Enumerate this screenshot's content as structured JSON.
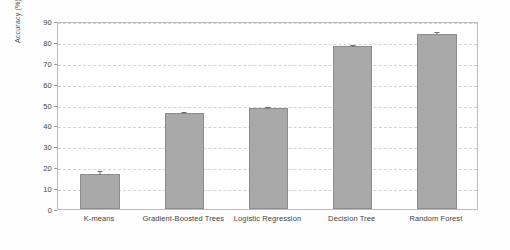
{
  "chart_data": {
    "type": "bar",
    "title": "",
    "xlabel": "",
    "ylabel": "Accuracy (%)",
    "categories": [
      "K-means",
      "Gradient-Boosted Trees",
      "Logistic Regression",
      "Decision Tree",
      "Random Forest"
    ],
    "values": [
      17,
      46,
      48.5,
      78,
      84
    ],
    "errors": [
      1.8,
      0.8,
      0.9,
      1.2,
      1.0
    ],
    "ylim": [
      0,
      90
    ],
    "ytick_labels": [
      "0",
      "10",
      "20",
      "30",
      "40",
      "50",
      "60",
      "70",
      "80",
      "90"
    ],
    "ytick_values": [
      0,
      10,
      20,
      30,
      40,
      50,
      60,
      70,
      80,
      90
    ],
    "grid": true,
    "legend": false,
    "legend_position": "none",
    "bar_color": "#a9a9a9",
    "bar_edge_color": "#8c8c8c",
    "grid_color": "#cfd4dc",
    "axes_color": "#bdbdbd",
    "error_bar_color": "#6d6d6d",
    "background_color": "#ffffff"
  }
}
